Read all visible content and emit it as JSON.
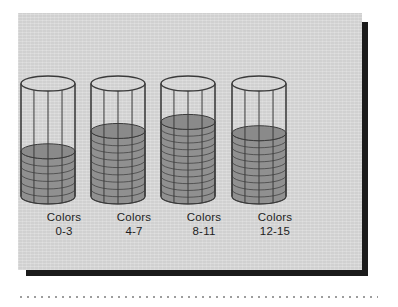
{
  "figure": {
    "background_color": "#d6d6d6",
    "page_color": "#ffffff",
    "shadow_color": "#1b1b1b",
    "ink_color": "#3a3a3a",
    "fill_color": "#8a8a8a"
  },
  "chart_data": {
    "type": "bar",
    "title": "",
    "subtitle": "",
    "xlabel": "",
    "ylabel": "",
    "grid": false,
    "legend": null,
    "categories": [
      "Colors 0-3",
      "Colors 4-7",
      "Colors 8-11",
      "Colors 12-15"
    ],
    "values": [
      40,
      58,
      66,
      56
    ],
    "ylim": [
      0,
      100
    ],
    "units": "percent of cylinder height",
    "series": [
      {
        "name": "fill level",
        "values": [
          40,
          58,
          66,
          56
        ]
      }
    ],
    "disc_counts": [
      6,
      9,
      11,
      9
    ],
    "tick_labels": []
  },
  "labels": [
    {
      "line1": "Colors",
      "line2": "0-3"
    },
    {
      "line1": "Colors",
      "line2": "4-7"
    },
    {
      "line1": "Colors",
      "line2": "8-11"
    },
    {
      "line1": "Colors",
      "line2": "12-15"
    }
  ]
}
